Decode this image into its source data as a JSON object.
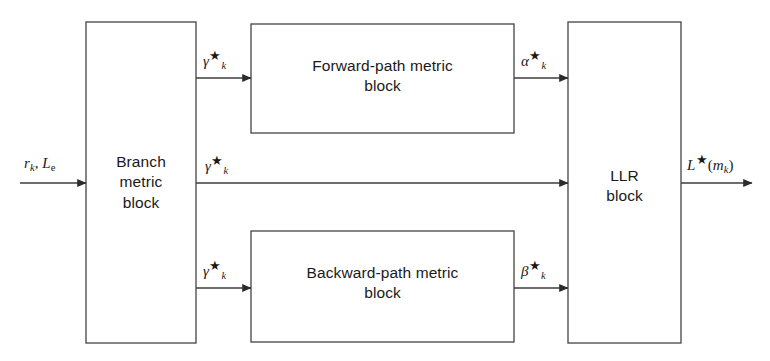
{
  "figure": {
    "type": "block-diagram",
    "background_color": "#ffffff",
    "line_color": "#3c3c3c"
  },
  "blocks": [
    {
      "id": "branch-metric",
      "line1": "Branch",
      "line2": "metric",
      "line3": "block",
      "x": 86,
      "y": 22,
      "w": 110,
      "h": 321
    },
    {
      "id": "forward-path-metric",
      "line1": "Forward-path metric",
      "line2": "block",
      "line3": "",
      "x": 251,
      "y": 24,
      "w": 263,
      "h": 109
    },
    {
      "id": "backward-path-metric",
      "line1": "Backward-path metric",
      "line2": "block",
      "line3": "",
      "x": 251,
      "y": 231,
      "w": 263,
      "h": 111
    },
    {
      "id": "llr",
      "line1": "LLR",
      "line2": "block",
      "line3": "",
      "x": 568,
      "y": 22,
      "w": 113,
      "h": 321
    }
  ],
  "signals": {
    "input": {
      "base": "r",
      "sub": "k",
      "sep": ", ",
      "base2": "L",
      "sub2": "e"
    },
    "gamma_top": {
      "base": "γ",
      "star": "★",
      "sub": "k"
    },
    "gamma_mid": {
      "base": "γ",
      "star": "★",
      "sub": "k"
    },
    "gamma_bot": {
      "base": "γ",
      "star": "★",
      "sub": "k"
    },
    "alpha": {
      "base": "α",
      "star": "★",
      "sub": "k"
    },
    "beta": {
      "base": "β",
      "star": "★",
      "sub": "k"
    },
    "output": {
      "base": "L",
      "star": "★",
      "open": "(",
      "mbase": "m",
      "msub": "k",
      "close": ")"
    }
  },
  "connections": [
    {
      "id": "input-to-branch",
      "from": "external-input",
      "to": "branch-metric",
      "label": "r_k, L_e",
      "y": 183
    },
    {
      "id": "branch-to-forward",
      "from": "branch-metric",
      "to": "forward-path-metric",
      "label": "gamma*_k",
      "y": 78
    },
    {
      "id": "branch-to-llr",
      "from": "branch-metric",
      "to": "llr",
      "label": "gamma*_k",
      "y": 183
    },
    {
      "id": "branch-to-backward",
      "from": "branch-metric",
      "to": "backward-path-metric",
      "label": "gamma*_k",
      "y": 288
    },
    {
      "id": "forward-to-llr",
      "from": "forward-path-metric",
      "to": "llr",
      "label": "alpha*_k",
      "y": 78
    },
    {
      "id": "backward-to-llr",
      "from": "backward-path-metric",
      "to": "llr",
      "label": "beta*_k",
      "y": 288
    },
    {
      "id": "llr-to-output",
      "from": "llr",
      "to": "external-output",
      "label": "L*(m_k)",
      "y": 183
    }
  ]
}
